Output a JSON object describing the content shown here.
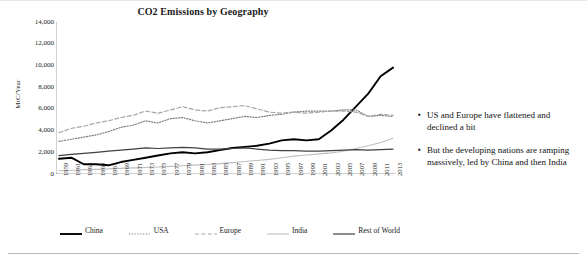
{
  "chart_data": {
    "type": "line",
    "title": "CO2 Emissions by Geography",
    "xlabel": "",
    "ylabel": "MtC/Year",
    "ylim": [
      0,
      14000
    ],
    "yticks": [
      "0",
      "2,000",
      "4,000",
      "6,000",
      "8,000",
      "10,000",
      "12,000",
      "14,000"
    ],
    "grid": false,
    "legend_position": "bottom",
    "x": [
      1959,
      1961,
      1963,
      1965,
      1967,
      1969,
      1971,
      1973,
      1975,
      1977,
      1979,
      1981,
      1983,
      1985,
      1987,
      1989,
      1991,
      1993,
      1995,
      1997,
      1999,
      2001,
      2003,
      2005,
      2007,
      2009,
      2011,
      2013
    ],
    "xtick_labels": [
      "1959",
      "1961",
      "1963",
      "1965",
      "1967",
      "1969",
      "1971",
      "1973",
      "1975",
      "1977",
      "1979",
      "1981",
      "1983",
      "1985",
      "1987",
      "1989",
      "1991",
      "1993",
      "1995",
      "1997",
      "1999",
      "2001",
      "2003",
      "2005",
      "2007",
      "2009",
      "2011",
      "2013"
    ],
    "series": [
      {
        "name": "China",
        "color": "#000000",
        "style": "solid-thick",
        "values": [
          1400,
          1500,
          900,
          900,
          800,
          1100,
          1300,
          1500,
          1700,
          1900,
          2000,
          1900,
          2000,
          2200,
          2400,
          2500,
          2600,
          2800,
          3100,
          3200,
          3100,
          3200,
          4000,
          5000,
          6200,
          7400,
          9000,
          9800
        ]
      },
      {
        "name": "USA",
        "color": "#7f7f7f",
        "style": "dotted",
        "values": [
          3000,
          3200,
          3400,
          3600,
          3900,
          4300,
          4500,
          4900,
          4700,
          5100,
          5200,
          4900,
          4700,
          4900,
          5100,
          5300,
          5200,
          5400,
          5500,
          5700,
          5800,
          5800,
          5800,
          5900,
          5900,
          5300,
          5400,
          5300
        ]
      },
      {
        "name": "Europe",
        "color": "#a6a6a6",
        "style": "dashed",
        "values": [
          3800,
          4200,
          4400,
          4700,
          4900,
          5200,
          5400,
          5800,
          5600,
          5900,
          6200,
          5900,
          5800,
          6100,
          6200,
          6300,
          6000,
          5700,
          5600,
          5700,
          5600,
          5700,
          5800,
          5800,
          5700,
          5300,
          5500,
          5400
        ]
      },
      {
        "name": "India",
        "color": "#bfbfbf",
        "style": "solid-thin",
        "values": [
          300,
          350,
          400,
          430,
          470,
          520,
          560,
          600,
          650,
          700,
          760,
          820,
          880,
          960,
          1050,
          1150,
          1250,
          1350,
          1500,
          1650,
          1750,
          1850,
          1950,
          2100,
          2350,
          2600,
          2900,
          3300
        ]
      },
      {
        "name": "Rest of World",
        "color": "#404040",
        "style": "solid-med",
        "values": [
          1700,
          1800,
          1900,
          2000,
          2100,
          2200,
          2300,
          2400,
          2350,
          2400,
          2450,
          2400,
          2300,
          2300,
          2350,
          2400,
          2300,
          2200,
          2150,
          2150,
          2100,
          2100,
          2150,
          2200,
          2250,
          2200,
          2250,
          2300
        ]
      }
    ]
  },
  "bullets": [
    "US and Europe have flattened and declined a bit",
    "But the developing nations are ramping massively, led by China and then India"
  ],
  "bullet_marker": "▪"
}
